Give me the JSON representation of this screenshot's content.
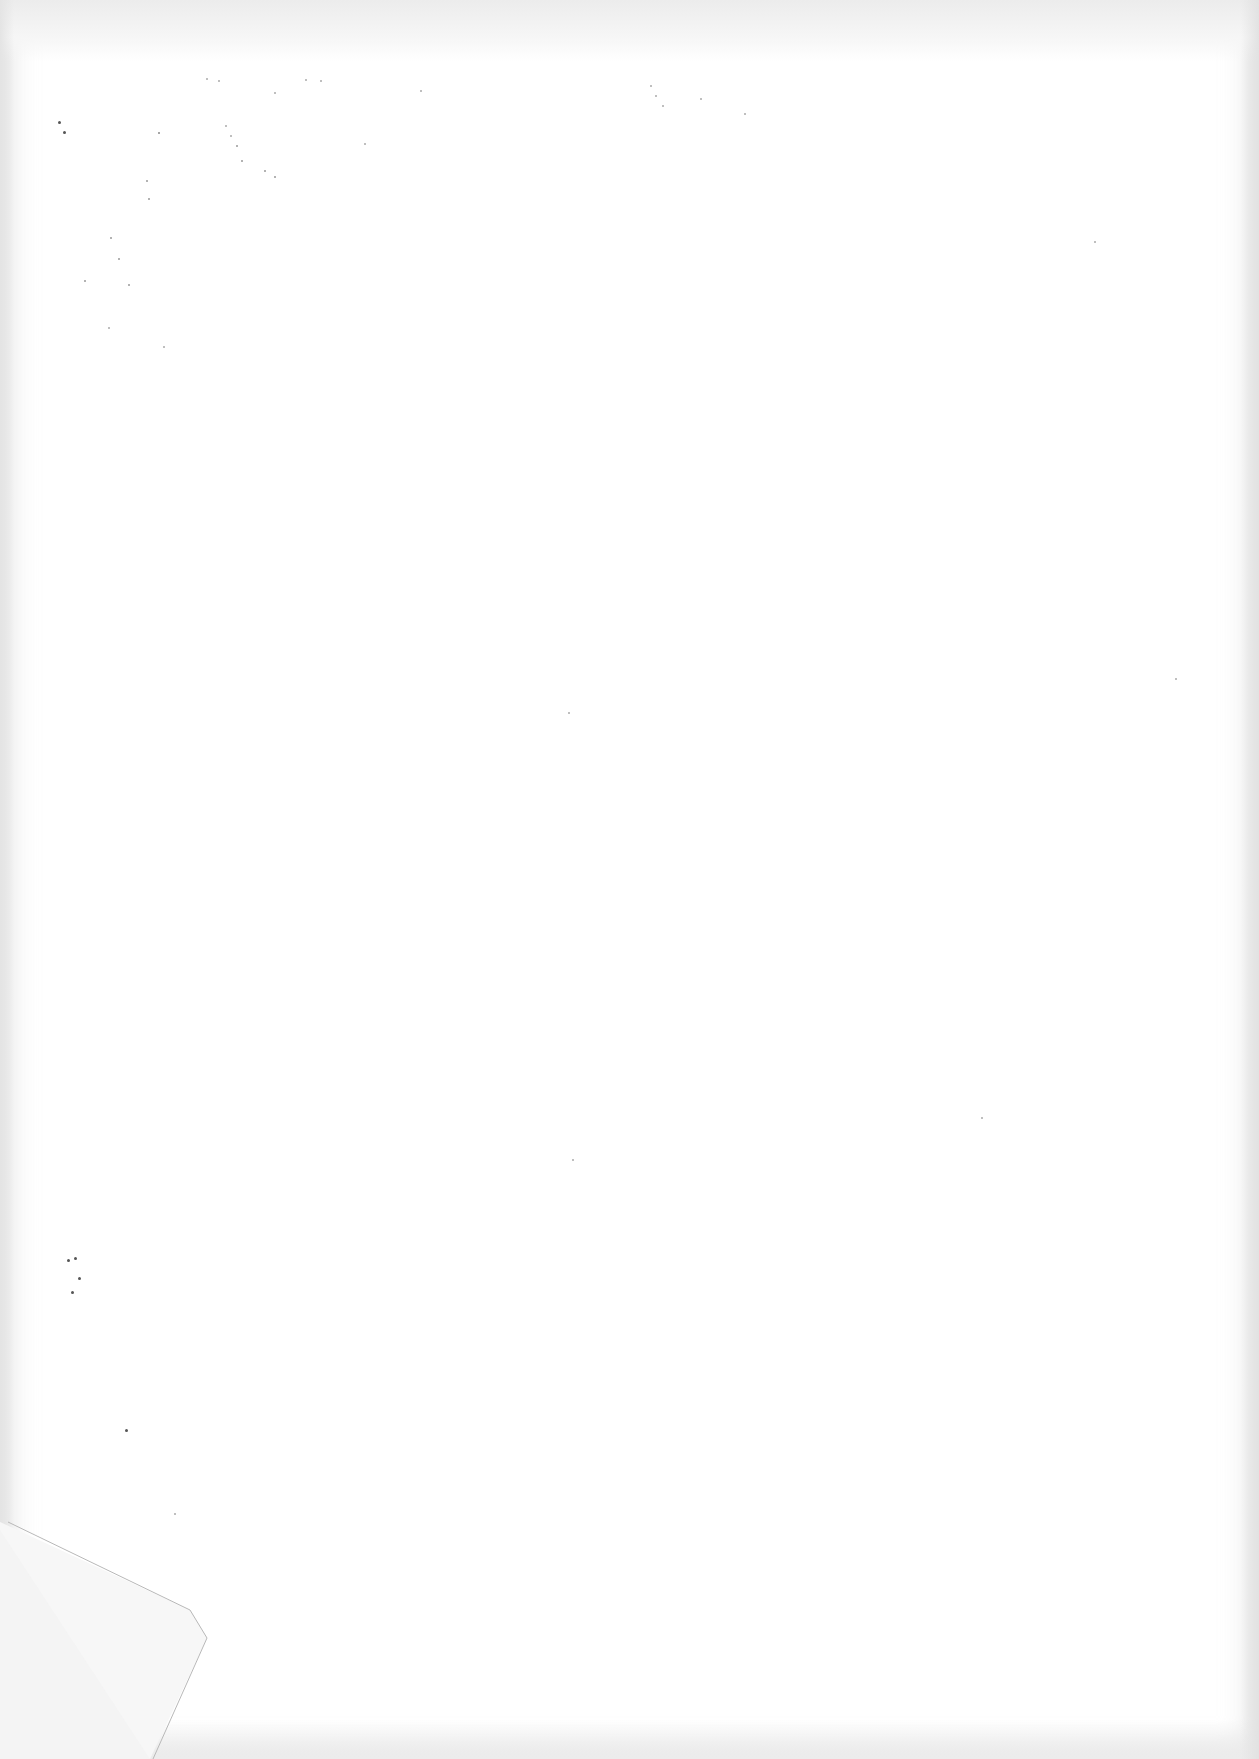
{
  "page": {
    "type": "blank-scanned-sheet",
    "background_color": "#ffffff",
    "edge_shade_color": "#e4e4e4",
    "speck_color": "#555555",
    "text_content": ""
  },
  "features": {
    "folded_corner": "bottom-left",
    "scan_noise": "scattered dust specks near top-left and left edge"
  }
}
